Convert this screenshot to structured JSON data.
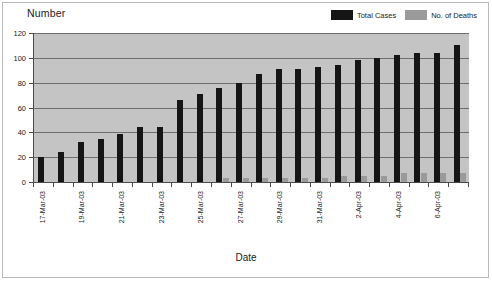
{
  "chart_data": {
    "type": "bar",
    "title": "",
    "ylabel": "Number",
    "xlabel": "Date",
    "ylim": [
      0,
      120
    ],
    "ytick_step": 20,
    "yticks": [
      0,
      20,
      40,
      60,
      80,
      100,
      120
    ],
    "grid": true,
    "legend_position": "top-right",
    "categories": [
      "17-Mar-03",
      "18-Mar-03",
      "19-Mar-03",
      "20-Mar-03",
      "21-Mar-03",
      "22-Mar-03",
      "23-Mar-03",
      "24-Mar-03",
      "25-Mar-03",
      "26-Mar-03",
      "27-Mar-03",
      "28-Mar-03",
      "29-Mar-03",
      "30-Mar-03",
      "31-Mar-03",
      "1-Apr-03",
      "2-Apr-03",
      "3-Apr-03",
      "4-Apr-03",
      "5-Apr-03",
      "6-Apr-03",
      "7-Apr-03"
    ],
    "tick_labels": [
      "17-Mar-03",
      "",
      "19-Mar-03",
      "",
      "21-Mar-03",
      "",
      "23-Mar-03",
      "",
      "25-Mar-03",
      "",
      "27-Mar-03",
      "",
      "29-Mar-03",
      "",
      "31-Mar-03",
      "",
      "2-Apr-03",
      "",
      "4-Apr-03",
      "",
      "6-Apr-03",
      ""
    ],
    "series": [
      {
        "name": "Total Cases",
        "color": "#151515",
        "values": [
          20,
          24,
          32,
          35,
          39,
          44,
          44,
          66,
          71,
          76,
          80,
          87,
          91,
          91,
          93,
          94,
          98,
          100,
          102,
          104,
          104,
          110
        ]
      },
      {
        "name": "No. of Deaths",
        "color": "#9a9a9a",
        "values": [
          0,
          0,
          0,
          0,
          0,
          0,
          0,
          0,
          0,
          3,
          3,
          3,
          3,
          3,
          3,
          5,
          5,
          5,
          7,
          7,
          7,
          7
        ]
      }
    ]
  },
  "axes": {
    "y_caption": "Number",
    "x_caption": "Date"
  },
  "legend": {
    "items": [
      {
        "label": "Total Cases",
        "color": "#151515"
      },
      {
        "label": "No. of Deaths",
        "color": "#9a9a9a"
      }
    ]
  },
  "colors": {
    "plot_background": "#c4c4c4",
    "gridline": "#6e6e6e",
    "axis": "#4a4a4a",
    "frame": "#b9b9b9",
    "page_background": "#ffffff"
  }
}
